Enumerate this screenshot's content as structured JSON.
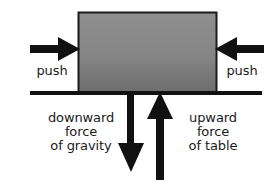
{
  "diagram": {
    "colors": {
      "background": "#ffffff",
      "stroke": "#111111",
      "box_fill_top": "#8e8e8e",
      "box_fill_bottom": "#6f6f6f",
      "box_border": "#1a1a1a",
      "text": "#1a1a1a"
    },
    "block": {
      "name": "block",
      "x": 78,
      "y": 12,
      "width": 139,
      "height": 80
    },
    "table_line": {
      "name": "table-surface-line",
      "x1": 30,
      "x2": 262,
      "y": 93,
      "thickness": 4
    },
    "arrows": [
      {
        "id": "push-left",
        "direction": "right",
        "label": "push",
        "x_start": 30,
        "x_end": 78,
        "y": 49
      },
      {
        "id": "push-right",
        "direction": "left",
        "label": "push",
        "x_start": 264,
        "x_end": 217,
        "y": 49
      },
      {
        "id": "gravity",
        "direction": "down",
        "label": "downward force of gravity",
        "x": 131,
        "y_start": 93,
        "y_end": 172
      },
      {
        "id": "normal",
        "direction": "up",
        "label": "upward force of table",
        "x": 160,
        "y_start": 180,
        "y_end": 93
      }
    ]
  },
  "labels": {
    "push_left": "push",
    "push_right": "push",
    "gravity": {
      "line1": "downward",
      "line2": "force",
      "line3": "of gravity"
    },
    "table": {
      "line1": "upward",
      "line2": "force",
      "line3": "of table"
    }
  }
}
